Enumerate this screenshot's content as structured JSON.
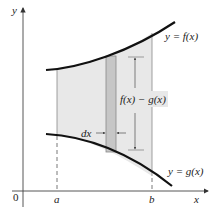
{
  "diagram": {
    "axes": {
      "x_label": "x",
      "y_label": "y",
      "origin_label": "0",
      "tick_labels": [
        "a",
        "b"
      ]
    },
    "curves": [
      {
        "name": "f",
        "label": "y = f(x)",
        "position": "upper"
      },
      {
        "name": "g",
        "label": "y = g(x)",
        "position": "lower"
      }
    ],
    "annotations": {
      "height_label": "f(x) − g(x)",
      "width_label": "dx"
    },
    "colors": {
      "curve": "#111111",
      "shaded_region": "#e6e6e6",
      "strip": "#c4c4c4",
      "axis": "#444444"
    }
  }
}
